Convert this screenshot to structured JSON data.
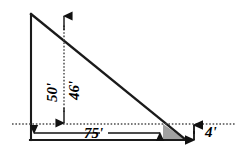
{
  "figure": {
    "type": "right-triangle-cross-section",
    "colors": {
      "stroke": "#1a1a1a",
      "dotted": "#4d4d4d",
      "shaded_fill": "#a0a0a0",
      "background": "#ffffff"
    },
    "labels": {
      "vertical_left": "50'",
      "vertical_inner": "46'",
      "horizontal_base": "75'",
      "vertical_right": "4'"
    },
    "dimensions": [
      {
        "id": "left-height",
        "value": 50,
        "unit": "ft",
        "text": "50'",
        "orientation": "vertical"
      },
      {
        "id": "inner-height",
        "value": 46,
        "unit": "ft",
        "text": "46'",
        "orientation": "vertical"
      },
      {
        "id": "base-length",
        "value": 75,
        "unit": "ft",
        "text": "75'",
        "orientation": "horizontal"
      },
      {
        "id": "right-height",
        "value": 4,
        "unit": "ft",
        "text": "4'",
        "orientation": "vertical"
      }
    ],
    "geometry": {
      "apex": [
        31,
        14
      ],
      "bottom_left": [
        31,
        140
      ],
      "bottom_right": [
        186,
        140
      ],
      "dotted_line_y": 124,
      "hypotenuse_dotted_intersection": [
        163,
        124
      ],
      "inner_arrow_x": 64,
      "dotted_line_x_start": 12,
      "dotted_line_x_end": 236
    }
  }
}
